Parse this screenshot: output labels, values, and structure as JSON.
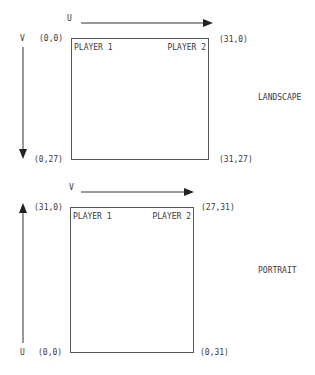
{
  "landscape": {
    "label": "LANDSCAPE",
    "u_axis": "U",
    "v_axis": "V",
    "player1": "PLAYER 1",
    "player2": "PLAYER 2",
    "corner_top_left": "(0,0)",
    "corner_top_right": "(31,0)",
    "corner_bottom_left": "(0,27)",
    "corner_bottom_right": "(31,27)"
  },
  "portrait": {
    "label": "PORTRAIT",
    "v_axis": "V",
    "u_axis": "U",
    "player1": "PLAYER 1",
    "player2": "PLAYER 2",
    "corner_top_left": "(31,0)",
    "corner_top_right": "(27,31)",
    "corner_bottom_left": "(0,0)",
    "corner_bottom_right": "(0,31)"
  },
  "colors": {
    "line": "#333333",
    "box_border": "#555555",
    "text": "#3a3a3a"
  }
}
